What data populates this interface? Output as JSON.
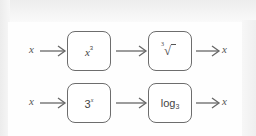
{
  "figure": {
    "rows": [
      {
        "input": "x",
        "machines": [
          {
            "label_base": "x",
            "label_sup": "3",
            "type": "power"
          },
          {
            "label_index": "3",
            "label_symbol": "√",
            "type": "cube-root"
          }
        ],
        "output": "x"
      },
      {
        "input": "x",
        "machines": [
          {
            "label_base": "3",
            "label_sup": "x",
            "type": "exponential"
          },
          {
            "label_base": "log",
            "label_sub": "3",
            "type": "logarithm"
          }
        ],
        "output": "x"
      }
    ],
    "colors": {
      "stroke": "#6d6d6d",
      "text": "#444444",
      "background": "#fefefe"
    }
  }
}
